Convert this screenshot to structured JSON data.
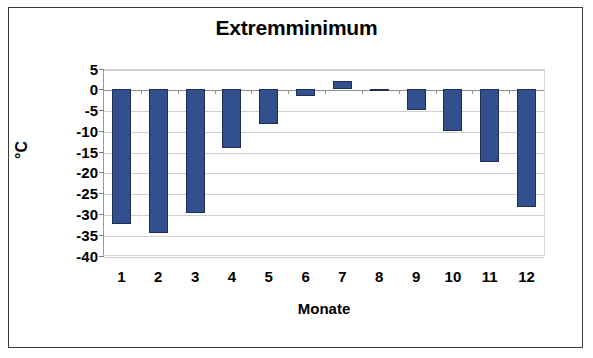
{
  "frame": {
    "border_color": "#3b3b3b",
    "background": "#ffffff"
  },
  "chart_data": {
    "type": "bar",
    "title": "Extremminimum",
    "xlabel": "Monate",
    "ylabel": "°C",
    "categories": [
      "1",
      "2",
      "3",
      "4",
      "5",
      "6",
      "7",
      "8",
      "9",
      "10",
      "11",
      "12"
    ],
    "values": [
      -32.5,
      -34.5,
      -29.8,
      -14.2,
      -8.3,
      -1.6,
      1.9,
      -0.5,
      -5.0,
      -10.0,
      -17.5,
      -28.3
    ],
    "series": [
      {
        "name": "Extremminimum",
        "color": "#33508e",
        "values": [
          -32.5,
          -34.5,
          -29.8,
          -14.2,
          -8.3,
          -1.6,
          1.9,
          -0.5,
          -5.0,
          -10.0,
          -17.5,
          -28.3
        ]
      }
    ],
    "ylim": [
      -40,
      5
    ],
    "yticks": [
      5,
      0,
      -5,
      -10,
      -15,
      -20,
      -25,
      -30,
      -35,
      -40
    ],
    "ytick_labels": [
      "5",
      "0",
      "-5",
      "-10",
      "-15",
      "-20",
      "-25",
      "-30",
      "-35",
      "-40"
    ],
    "grid": true,
    "gridline_color": "#cfcfcf",
    "zeroline_color": "#8e8e8e",
    "legend": false,
    "legend_position": "none",
    "bar_color": "#33508e",
    "bar_border_color": "#1d2d55",
    "plot_background": "#ffffff"
  }
}
